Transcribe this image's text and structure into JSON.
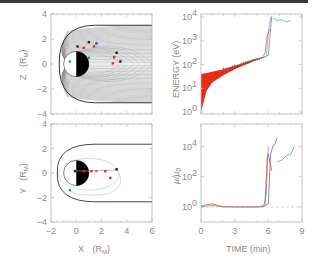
{
  "figure": {
    "panels": [
      "xz-field-lines",
      "energy-vs-time",
      "xy-trajectories",
      "mu-ratio-vs-time"
    ]
  },
  "chart_data": [
    {
      "type": "line",
      "title": "",
      "xlabel": "",
      "ylabel": "Z (R_M)",
      "ylabel_main": "Z",
      "ylabel_unit": "(R",
      "ylabel_sub": "M",
      "ylabel_close": ")",
      "xlim": [
        -2,
        6
      ],
      "ylim": [
        -4,
        4
      ],
      "xticks": [
        -2,
        0,
        2,
        4,
        6
      ],
      "yticks": [
        -4,
        -2,
        0,
        2,
        4
      ],
      "ytick_labels": [
        "−4",
        "−2",
        "0",
        "2",
        "4"
      ],
      "description": "Magnetic field lines in X-Z plane (tail stretched), planet at origin with dayside white / nightside black, particle trajectories with markers",
      "field_line_count": 30,
      "tail_halfwidth": 3.1,
      "planet_radius": 1.0,
      "markers": [
        {
          "x": 0.1,
          "z": 1.4,
          "color": "#222222"
        },
        {
          "x": 0.6,
          "z": 1.3,
          "color": "#d03030"
        },
        {
          "x": 1.0,
          "z": 1.75,
          "color": "#222222"
        },
        {
          "x": 1.6,
          "z": 1.65,
          "color": "#2050c0"
        },
        {
          "x": 1.4,
          "z": 1.4,
          "color": "#d03030"
        },
        {
          "x": 3.2,
          "z": 0.9,
          "color": "#222222"
        },
        {
          "x": 3.0,
          "z": 0.55,
          "color": "#d03030"
        },
        {
          "x": 3.5,
          "z": 0.2,
          "color": "#222222"
        },
        {
          "x": 2.9,
          "z": 0.05,
          "color": "#d03030"
        },
        {
          "x": 1.0,
          "z": 0.5,
          "color": "#2aa050"
        },
        {
          "x": -0.5,
          "z": 0.2,
          "color": "#2aa050"
        }
      ]
    },
    {
      "type": "line",
      "title": "",
      "xlabel": "",
      "ylabel": "ENERGY (eV)",
      "xlim": [
        0,
        9
      ],
      "ylim_log10": [
        0,
        4.05
      ],
      "xticks": [
        0,
        3,
        6,
        9
      ],
      "yticks_exp": [
        0,
        1,
        2,
        3,
        4
      ],
      "ytick_base": "10",
      "description": "Particle energy vs time: red band of initial energies 1-40 eV converging to ~200 eV at 5.5 min, then sharp rise to ~10 keV at ~6 min",
      "series": [
        {
          "name": "ensemble-low",
          "color": "#e82a1a",
          "t": [
            0,
            0.5,
            1,
            2,
            3,
            4,
            5,
            5.5
          ],
          "log_energy": [
            0,
            0.9,
            1.25,
            1.55,
            1.8,
            2.0,
            2.2,
            2.3
          ]
        },
        {
          "name": "ensemble-high",
          "color": "#e82a1a",
          "t": [
            0,
            0.5,
            1,
            2,
            3,
            4,
            5,
            5.5
          ],
          "log_energy": [
            1.6,
            1.65,
            1.7,
            1.8,
            1.95,
            2.1,
            2.25,
            2.3
          ]
        },
        {
          "name": "trajectory-gray",
          "color": "#888888",
          "t": [
            2,
            3,
            4,
            5,
            5.6,
            5.8,
            6.0,
            6.2
          ],
          "log_energy": [
            1.8,
            1.95,
            2.1,
            2.25,
            2.3,
            2.35,
            3.3,
            4.0
          ]
        },
        {
          "name": "trajectory-blue",
          "color": "#4060b0",
          "t": [
            4,
            5,
            5.6,
            6.0,
            6.2,
            6.3
          ],
          "log_energy": [
            2.1,
            2.25,
            2.3,
            2.4,
            3.5,
            4.05
          ]
        },
        {
          "name": "trajectory-red",
          "color": "#d03030",
          "t": [
            5.5,
            5.7,
            5.9,
            6.1
          ],
          "log_energy": [
            2.3,
            2.5,
            3.2,
            3.5
          ]
        },
        {
          "name": "trajectory-green",
          "color": "#2aa050",
          "t": [
            6.4,
            6.8,
            7.2,
            7.6,
            8.0
          ],
          "log_energy": [
            3.95,
            3.85,
            3.9,
            3.8,
            3.85
          ]
        }
      ]
    },
    {
      "type": "line",
      "title": "",
      "xlabel": "X (R_M)",
      "xlabel_main": "X",
      "xlabel_unit": "(R",
      "xlabel_sub": "M",
      "xlabel_close": ")",
      "ylabel": "Y (R_M)",
      "ylabel_main": "Y",
      "ylabel_unit": "(R",
      "ylabel_sub": "M",
      "ylabel_close": ")",
      "xlim": [
        -2,
        6
      ],
      "ylim": [
        -4,
        4
      ],
      "xticks": [
        -2,
        0,
        2,
        4,
        6
      ],
      "xtick_labels": [
        "−2",
        "0",
        "2",
        "4",
        "6"
      ],
      "yticks": [
        -4,
        -2,
        0,
        2,
        4
      ],
      "ytick_labels": [
        "−4",
        "−2",
        "0",
        "2",
        "4"
      ],
      "description": "Equatorial X-Y plane: magnetopause boundary, planet (dayside white, nightside black), particle drift paths",
      "magnetopause_halfwidth": 2.35,
      "magnetopause_nose": -1.5,
      "planet_radius": 1.0,
      "markers": [
        {
          "x": -0.1,
          "y": 0.15,
          "color": "#222222"
        },
        {
          "x": 0.6,
          "y": 0.15,
          "color": "#d03030"
        },
        {
          "x": 1.2,
          "y": 0.15,
          "color": "#d03030"
        },
        {
          "x": 1.6,
          "y": 0.15,
          "color": "#888888"
        },
        {
          "x": 2.3,
          "y": 0.15,
          "color": "#d03030"
        },
        {
          "x": 3.2,
          "y": 0.3,
          "color": "#222222"
        },
        {
          "x": 2.7,
          "y": -0.4,
          "color": "#d03030"
        },
        {
          "x": -0.5,
          "y": -1.4,
          "color": "#2aa050"
        }
      ]
    },
    {
      "type": "line",
      "title": "",
      "xlabel": "TIME (min)",
      "ylabel": "μ/μ0",
      "ylabel_main": "μ/μ",
      "ylabel_sub": "0",
      "xlim": [
        0,
        9
      ],
      "ylim_log10": [
        -1,
        5.5
      ],
      "xticks": [
        0,
        3,
        6,
        9
      ],
      "xtick_labels": [
        "0",
        "3",
        "6",
        "9"
      ],
      "yticks_exp": [
        0,
        2,
        4
      ],
      "ytick_base": "10",
      "reference_line": {
        "log_value": 0,
        "style": "dashed",
        "color": "#bbbbbb"
      },
      "description": "Magnetic moment ratio vs time: near 1 until ~6 min, then jumps to 10^3-10^5",
      "series": [
        {
          "name": "ratio-red",
          "color": "#d03030",
          "t": [
            0,
            0.5,
            1.0,
            1.5,
            2,
            3,
            4,
            5,
            5.5
          ],
          "log_mu": [
            0.05,
            0.15,
            0.2,
            0.1,
            0.02,
            0.0,
            0.0,
            0.0,
            0.0
          ]
        },
        {
          "name": "ratio-gray",
          "color": "#888888",
          "t": [
            0,
            1,
            2,
            3,
            4,
            5,
            5.6,
            5.8,
            6.0
          ],
          "log_mu": [
            0.0,
            0.1,
            0.0,
            0.0,
            0.0,
            0.0,
            0.1,
            0.8,
            4.0
          ]
        },
        {
          "name": "ratio-blue",
          "color": "#4060b0",
          "t": [
            5.5,
            6.0,
            6.2,
            6.4,
            6.6,
            6.8
          ],
          "log_mu": [
            0.0,
            0.2,
            3.5,
            4.0,
            4.2,
            4.6
          ]
        },
        {
          "name": "ratio-red-jump",
          "color": "#d03030",
          "t": [
            5.7,
            5.9,
            6.0,
            6.3
          ],
          "log_mu": [
            0.1,
            3.2,
            3.5,
            2.4
          ]
        },
        {
          "name": "ratio-green",
          "color": "#2aa050",
          "t": [
            6.8,
            7.2,
            7.6,
            8.0,
            8.3
          ],
          "log_mu": [
            3.0,
            3.1,
            3.4,
            3.5,
            4.0
          ]
        }
      ]
    }
  ]
}
